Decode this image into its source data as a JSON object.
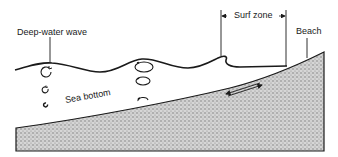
{
  "diagram": {
    "labels": {
      "deep_water_wave": "Deep-water wave",
      "surf_zone": "Surf zone",
      "beach": "Beach",
      "sea_bottom": "Sea bottom"
    },
    "elements": [
      {
        "id": "water-surface",
        "type": "wave-line",
        "description": "Sinusoidal water surface becoming steeper and breaking near the surf zone"
      },
      {
        "id": "seabed",
        "type": "stippled-wedge",
        "description": "Sloping sea floor rising to the beach"
      },
      {
        "id": "orbitals-deep",
        "type": "circular-orbits",
        "count": 3,
        "description": "Circular water-particle orbits decreasing with depth"
      },
      {
        "id": "orbitals-shallow",
        "type": "elliptical-orbits",
        "count": 3,
        "description": "Flattened elliptical orbits as depth decreases"
      },
      {
        "id": "swash-arrow",
        "type": "double-arrow",
        "description": "Back-and-forth motion along the bottom in the surf zone"
      }
    ],
    "colors": {
      "line": "#1a1a1a",
      "seabed_fill": "#bdbdbd",
      "background": "#ffffff"
    }
  }
}
